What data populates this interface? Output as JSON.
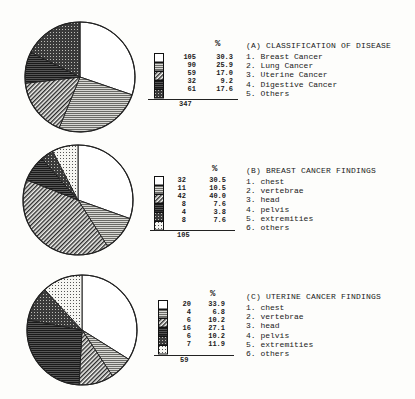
{
  "chart_data": [
    {
      "type": "pie",
      "title": "(A) CLASSIFICATION OF DISEASE",
      "categories": [
        "Breast Cancer",
        "Lung Cancer",
        "Uterine Cancer",
        "Digestive Cancer",
        "Others"
      ],
      "values": [
        105,
        90,
        59,
        32,
        61
      ],
      "percent": [
        30.3,
        25.9,
        17.0,
        9.2,
        17.6
      ],
      "total": 347,
      "patterns": [
        "white",
        "horizontal-light",
        "diagonal",
        "dark-horizontal",
        "crosshatch"
      ],
      "legend_position": "right"
    },
    {
      "type": "pie",
      "title": "(B) BREAST CANCER FINDINGS",
      "categories": [
        "chest",
        "vertebrae",
        "head",
        "pelvis",
        "extremities",
        "others"
      ],
      "values": [
        32,
        11,
        42,
        8,
        4,
        8
      ],
      "percent": [
        30.5,
        10.5,
        40.0,
        7.6,
        3.8,
        7.6
      ],
      "total": 105,
      "patterns": [
        "white",
        "horizontal-light",
        "diagonal",
        "dark-horizontal",
        "crosshatch",
        "dots"
      ],
      "legend_position": "right"
    },
    {
      "type": "pie",
      "title": "(C) UTERINE CANCER FINDINGS",
      "categories": [
        "chest",
        "vertebrae",
        "head",
        "pelvis",
        "extremities",
        "others"
      ],
      "values": [
        20,
        4,
        6,
        16,
        6,
        7
      ],
      "percent": [
        33.9,
        6.8,
        10.2,
        27.1,
        10.2,
        11.9
      ],
      "total": 59,
      "patterns": [
        "white",
        "horizontal-light",
        "diagonal",
        "dark-horizontal",
        "crosshatch",
        "dots"
      ],
      "legend_position": "right"
    }
  ],
  "percent_header": "%",
  "charts": {
    "a": {
      "title": "(A) CLASSIFICATION OF DISEASE",
      "items": [
        "1. Breast Cancer",
        "2. Lung Cancer",
        "3. Uterine Cancer",
        "4. Digestive Cancer",
        "5. Others"
      ],
      "counts": [
        "105",
        "90",
        "59",
        "32",
        "61"
      ],
      "percents": [
        "30.3",
        "25.9",
        "17.0",
        "9.2",
        "17.6"
      ],
      "total": "347"
    },
    "b": {
      "title": "(B) BREAST CANCER FINDINGS",
      "items": [
        "1. chest",
        "2. vertebrae",
        "3. head",
        "4. pelvis",
        "5. extremities",
        "6. others"
      ],
      "counts": [
        "32",
        "11",
        "42",
        "8",
        "4",
        "8"
      ],
      "percents": [
        "30.5",
        "10.5",
        "40.0",
        "7.6",
        "3.8",
        "7.6"
      ],
      "total": "105"
    },
    "c": {
      "title": "(C) UTERINE CANCER FINDINGS",
      "items": [
        "1. chest",
        "2. vertebrae",
        "3. head",
        "4. pelvis",
        "5. extremities",
        "6. others"
      ],
      "counts": [
        "20",
        "4",
        "6",
        "16",
        "6",
        "7"
      ],
      "percents": [
        "33.9",
        "6.8",
        "10.2",
        "27.1",
        "10.2",
        "11.9"
      ],
      "total": "59"
    }
  }
}
